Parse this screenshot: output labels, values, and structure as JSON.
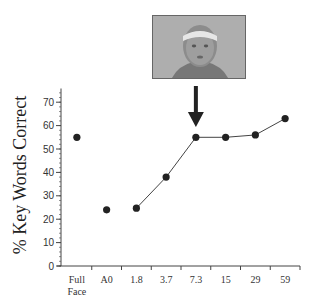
{
  "chart_data": {
    "type": "line",
    "title": "",
    "xlabel": "",
    "ylabel": "% Key Words Correct",
    "ylim": [
      0,
      75
    ],
    "yticks": [
      0,
      10,
      20,
      30,
      40,
      50,
      60,
      70
    ],
    "grid": false,
    "legend": null,
    "categories": [
      "Full Face",
      "A0",
      "1.8",
      "3.7",
      "7.3",
      "15",
      "29",
      "59"
    ],
    "category_label_lines": [
      [
        "Full",
        "Face"
      ],
      [
        "A0"
      ],
      [
        "1.8"
      ],
      [
        "3.7"
      ],
      [
        "7.3"
      ],
      [
        "15"
      ],
      [
        "29"
      ],
      [
        "59"
      ]
    ],
    "series": [
      {
        "name": "Key words correct",
        "values": [
          55,
          24,
          24.7,
          38,
          55,
          55,
          56,
          63
        ],
        "connected_segments": [
          [
            2,
            3,
            4,
            5,
            6,
            7
          ]
        ],
        "color": "#222222"
      }
    ],
    "annotations": [
      {
        "type": "arrow",
        "points_to_category": "7.3",
        "direction": "down"
      },
      {
        "type": "image",
        "description": "grayscale face photo above arrow",
        "above_category": "7.3"
      }
    ]
  },
  "labels": {
    "ylabel": "% Key Words Correct"
  },
  "colors": {
    "axis": "#444444",
    "marker": "#222222",
    "line": "#444444",
    "arrow": "#222222"
  }
}
